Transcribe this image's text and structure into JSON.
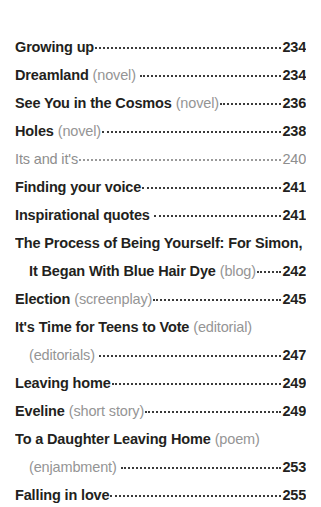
{
  "document": {
    "type": "table-of-contents",
    "background_color": "#ffffff",
    "title_color": "#231f20",
    "qualifier_color": "#959595",
    "muted_color": "#8e8e8e",
    "leader_color": "#3a3a3a"
  },
  "entries": [
    {
      "id": "growing-up",
      "title": "Growing up",
      "qualifier": "",
      "page": "234",
      "style": "bold",
      "lines": 1
    },
    {
      "id": "dreamland",
      "title": "Dreamland",
      "qualifier": "(novel)",
      "page": "234",
      "style": "bold",
      "lines": 1
    },
    {
      "id": "see-you-in-the-cosmos",
      "title": "See You in the Cosmos",
      "qualifier": "(novel)",
      "page": "236",
      "style": "bold",
      "lines": 1
    },
    {
      "id": "holes",
      "title": "Holes",
      "qualifier": "(novel)",
      "page": "238",
      "style": "bold",
      "lines": 1
    },
    {
      "id": "its-and-its",
      "title": "Its and it's",
      "qualifier": "",
      "page": "240",
      "style": "light",
      "lines": 1
    },
    {
      "id": "finding-your-voice",
      "title": "Finding your voice",
      "qualifier": "",
      "page": "241",
      "style": "bold",
      "lines": 1
    },
    {
      "id": "inspirational-quotes",
      "title": "Inspirational quotes",
      "qualifier": "",
      "page": "241",
      "style": "bold",
      "lines": 1
    },
    {
      "id": "the-process-of-being-yourself",
      "title": "The Process of Being Yourself: For Simon,",
      "title_line2": "It Began With Blue Hair Dye",
      "qualifier": "(blog)",
      "page": "242",
      "style": "bold",
      "lines": 2
    },
    {
      "id": "election",
      "title": "Election",
      "qualifier": "(screenplay)",
      "page": "245",
      "style": "bold",
      "lines": 1
    },
    {
      "id": "its-time-for-teens-to-vote",
      "title": "It's Time for Teens to Vote",
      "qualifier": "(editorial)",
      "qualifier_line2": "(editorials)",
      "page": "247",
      "style": "bold",
      "lines": 2
    },
    {
      "id": "leaving-home",
      "title": "Leaving home",
      "qualifier": "",
      "page": "249",
      "style": "bold",
      "lines": 1
    },
    {
      "id": "eveline",
      "title": "Eveline",
      "qualifier": "(short story)",
      "page": "249",
      "style": "bold",
      "lines": 1
    },
    {
      "id": "to-a-daughter-leaving-home",
      "title": "To a Daughter Leaving Home",
      "qualifier": "(poem)",
      "qualifier_line2": "(enjambment)",
      "page": "253",
      "style": "bold",
      "lines": 2
    },
    {
      "id": "falling-in-love",
      "title": "Falling in love",
      "qualifier": "",
      "page": "255",
      "style": "bold",
      "lines": 1
    }
  ]
}
